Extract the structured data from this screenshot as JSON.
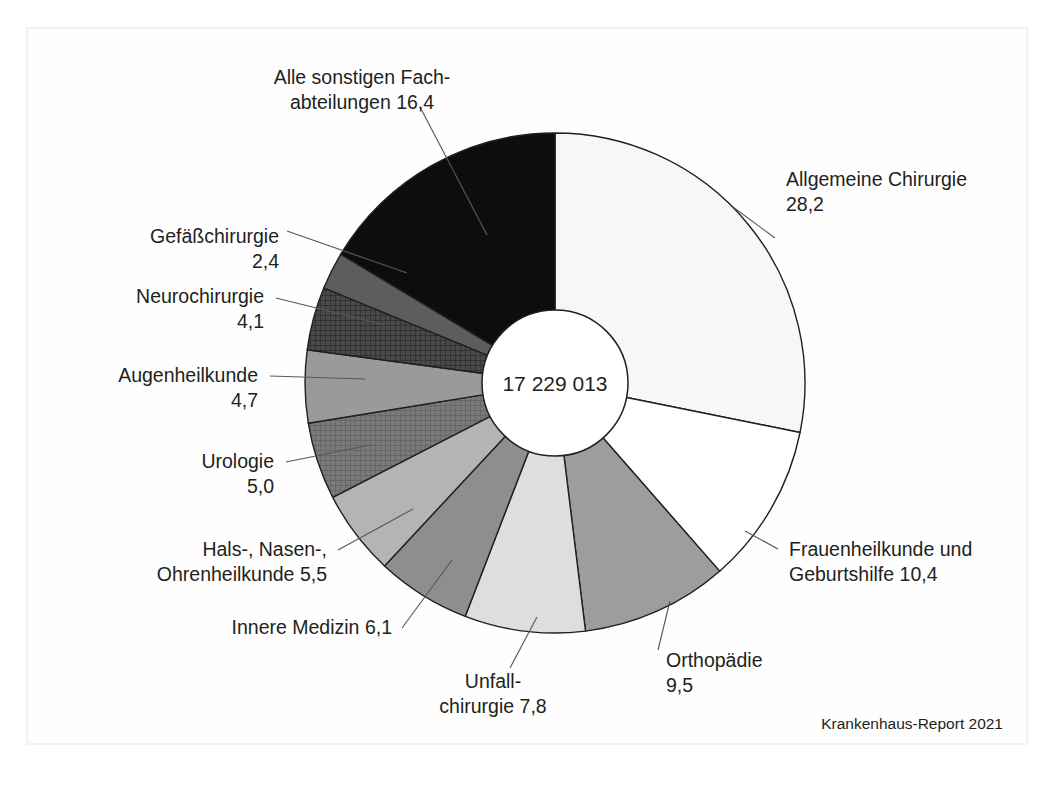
{
  "figure": {
    "center_value": "17 229 013",
    "credit": "Krankenhaus-Report 2021",
    "background": "#ffffff",
    "outline_color": "#231f20"
  },
  "chart_data": {
    "type": "pie",
    "title": "",
    "subtitle": "",
    "xlabel": "",
    "ylabel": "",
    "center_label": "17 229 013",
    "donut": true,
    "units": "percent",
    "start_angle_deg": 0,
    "direction": "clockwise",
    "legend_position": "none",
    "grid": false,
    "categories": [
      "Allgemeine Chirurgie",
      "Frauenheilkunde und Geburtshilfe",
      "Orthopädie",
      "Unfallchirurgie",
      "Innere Medizin",
      "Hals-, Nasen-, Ohrenheilkunde",
      "Urologie",
      "Augenheilkunde",
      "Neurochirurgie",
      "Gefäßchirurgie",
      "Alle sonstigen Fachabteilungen"
    ],
    "values": [
      28.2,
      10.4,
      9.5,
      7.8,
      6.1,
      5.5,
      5.0,
      4.7,
      4.1,
      2.4,
      16.4
    ],
    "value_strings": [
      "28,2",
      "10,4",
      "9,5",
      "7,8",
      "6,1",
      "5,5",
      "5,0",
      "4,7",
      "4,1",
      "2,4",
      "16,4"
    ],
    "colors": [
      "#f7f7f5",
      "#ffffff",
      "#9d9d9d",
      "#dededc",
      "#8e8e8e",
      "#b4b4b4",
      "#7a7a7a",
      "#9a9a9a",
      "#4a4a4a",
      "#5d5d5d",
      "#0d0d0d"
    ],
    "fill_patterns": [
      "solid",
      "solid",
      "solid",
      "solid",
      "solid",
      "solid",
      "crosshatch",
      "solid",
      "crosshatch",
      "solid",
      "solid"
    ]
  },
  "labels": [
    {
      "id": "allgemeine-chirurgie",
      "line1": "Allgemeine Chirurgie",
      "line2": "28,2",
      "x": 786,
      "y": 186,
      "align": "start"
    },
    {
      "id": "frauenheilkunde",
      "line1": "Frauenheilkunde und",
      "line2": "Geburtshilfe 10,4",
      "x": 789,
      "y": 556,
      "align": "start"
    },
    {
      "id": "orthopaedie",
      "line1": "Orthopädie",
      "line2": "9,5",
      "x": 666,
      "y": 667,
      "align": "start"
    },
    {
      "id": "unfallchirurgie",
      "line1": "Unfall-",
      "line2": "chirurgie 7,8",
      "x": 493,
      "y": 688,
      "align": "middle"
    },
    {
      "id": "innere-medizin",
      "line1": "Innere Medizin 6,1",
      "line2": "",
      "x": 392,
      "y": 634,
      "align": "end"
    },
    {
      "id": "hno",
      "line1": "Hals-, Nasen-,",
      "line2": "Ohrenheilkunde 5,5",
      "x": 327,
      "y": 556,
      "align": "end"
    },
    {
      "id": "urologie",
      "line1": "Urologie",
      "line2": "5,0",
      "x": 274,
      "y": 468,
      "align": "end"
    },
    {
      "id": "augenheilkunde",
      "line1": "Augenheilkunde",
      "line2": "4,7",
      "x": 258,
      "y": 382,
      "align": "end"
    },
    {
      "id": "neurochirurgie",
      "line1": "Neurochirurgie",
      "line2": "4,1",
      "x": 264,
      "y": 303,
      "align": "end"
    },
    {
      "id": "gefaesschirurgie",
      "line1": "Gefäßchirurgie",
      "line2": "2,4",
      "x": 279,
      "y": 243,
      "align": "end"
    },
    {
      "id": "alle-sonstigen",
      "line1": "Alle sonstigen Fach-",
      "line2": "abteilungen 16,4",
      "x": 362,
      "y": 84,
      "align": "middle"
    }
  ]
}
